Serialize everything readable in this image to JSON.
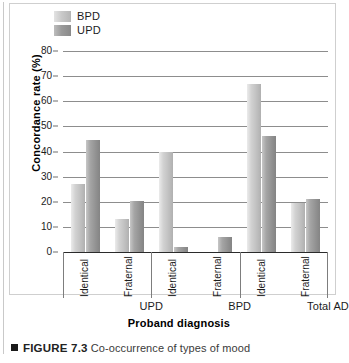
{
  "figure": {
    "caption_marker": "■",
    "caption_figure_number": "FIGURE 7.3",
    "caption_text": "Co-occurrence of types of mood"
  },
  "legend": {
    "position": "top-left",
    "items": [
      {
        "label": "BPD",
        "color": "#c9c9c9",
        "swatch": "bpd-swatch"
      },
      {
        "label": "UPD",
        "color": "#9a9a9a",
        "swatch": "upd-swatch"
      }
    ]
  },
  "chart_data": {
    "type": "bar",
    "title": "",
    "xlabel": "Proband diagnosis",
    "ylabel": "Concordance rate (%)",
    "ylim": [
      0,
      80
    ],
    "yticks": [
      0,
      10,
      20,
      30,
      40,
      50,
      60,
      70,
      80
    ],
    "grid": true,
    "legend_position": "top-left",
    "categories": [
      "Identical",
      "Fraternal",
      "Identical",
      "Fraternal",
      "Identical",
      "Fraternal"
    ],
    "groups": [
      {
        "label": "UPD",
        "categories": [
          "Identical",
          "Fraternal"
        ]
      },
      {
        "label": "BPD",
        "categories": [
          "Identical",
          "Fraternal"
        ]
      },
      {
        "label": "Total AD",
        "categories": [
          "Identical",
          "Fraternal"
        ]
      }
    ],
    "series": [
      {
        "name": "BPD",
        "color": "#c9c9c9",
        "values": [
          27,
          13,
          40,
          0,
          67,
          19.5
        ]
      },
      {
        "name": "UPD",
        "color": "#9a9a9a",
        "values": [
          44.5,
          20.5,
          2,
          6,
          46,
          21
        ]
      }
    ]
  }
}
